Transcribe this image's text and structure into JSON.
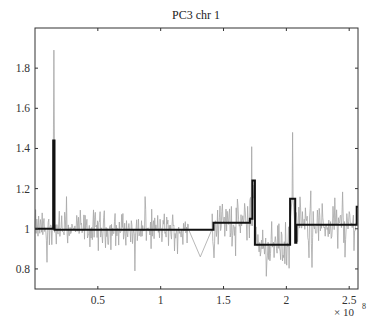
{
  "chart_data": {
    "type": "line",
    "title": "PC3 chr 1",
    "xlabel": "",
    "ylabel": "",
    "x_multiplier_label": "× 10",
    "x_multiplier_exponent": "8",
    "xlim": [
      0.0,
      2.57
    ],
    "ylim": [
      0.7,
      2.0
    ],
    "xticks": [
      0.5,
      1.0,
      1.5,
      2.0,
      2.5
    ],
    "xtick_labels": [
      "0.5",
      "1",
      "1.5",
      "2",
      "2.5"
    ],
    "yticks": [
      0.8,
      1.0,
      1.2,
      1.4,
      1.6,
      1.8
    ],
    "ytick_labels": [
      "0.8",
      "1",
      "1.2",
      "1.4",
      "1.6",
      "1.8"
    ],
    "grid": false,
    "legend": null,
    "series": [
      {
        "name": "raw copy-number ratio",
        "color": "#a6a6a6",
        "style": "thin noisy line",
        "noise_segments": [
          {
            "x_start": 0.0,
            "x_end": 0.145,
            "mean": 1.0,
            "spread": 0.05
          },
          {
            "x_start": 0.145,
            "x_end": 0.155,
            "mean": 1.44,
            "spread": 0.0,
            "peak": 1.89
          },
          {
            "x_start": 0.155,
            "x_end": 1.22,
            "mean": 0.995,
            "spread": 0.05,
            "min": 0.79,
            "max": 1.16
          },
          {
            "x_start": 1.22,
            "x_end": 1.41,
            "mean": 0.86,
            "spread": 0.0,
            "gap": true
          },
          {
            "x_start": 1.41,
            "x_end": 1.71,
            "mean": 1.03,
            "spread": 0.06
          },
          {
            "x_start": 1.71,
            "x_end": 1.75,
            "mean": 1.15,
            "spread": 0.08
          },
          {
            "x_start": 1.75,
            "x_end": 2.03,
            "mean": 0.92,
            "spread": 0.06
          },
          {
            "x_start": 2.03,
            "x_end": 2.07,
            "mean": 1.15,
            "spread": 0.1,
            "peak": 1.48
          },
          {
            "x_start": 2.07,
            "x_end": 2.56,
            "mean": 1.02,
            "spread": 0.06
          }
        ]
      },
      {
        "name": "segmented mean",
        "color": "#111111",
        "style": "thick step line",
        "steps": [
          {
            "x_start": 0.0,
            "x_end": 0.145,
            "value": 1.0
          },
          {
            "x_start": 0.145,
            "x_end": 0.155,
            "value": 1.44
          },
          {
            "x_start": 0.155,
            "x_end": 1.42,
            "value": 0.995
          },
          {
            "x_start": 1.42,
            "x_end": 1.71,
            "value": 1.03
          },
          {
            "x_start": 1.71,
            "x_end": 1.73,
            "value": 1.05
          },
          {
            "x_start": 1.73,
            "x_end": 1.75,
            "value": 1.24
          },
          {
            "x_start": 1.75,
            "x_end": 2.03,
            "value": 0.92
          },
          {
            "x_start": 2.03,
            "x_end": 2.07,
            "value": 1.15
          },
          {
            "x_start": 2.07,
            "x_end": 2.08,
            "value": 0.93
          },
          {
            "x_start": 2.08,
            "x_end": 2.56,
            "value": 1.02
          },
          {
            "x_start": 2.56,
            "x_end": 2.57,
            "value": 1.11
          }
        ]
      }
    ]
  }
}
